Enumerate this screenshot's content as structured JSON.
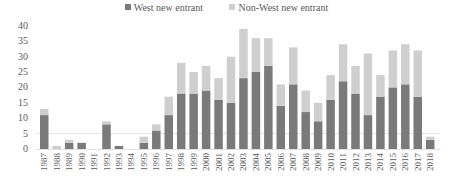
{
  "chart_data": {
    "type": "bar",
    "stacked": true,
    "title": "",
    "xlabel": "",
    "ylabel": "",
    "ylim": [
      0,
      40
    ],
    "yticks": [
      0,
      5,
      10,
      15,
      20,
      25,
      30,
      35,
      40
    ],
    "grid": false,
    "legend_position": "top",
    "categories": [
      "1987",
      "1988",
      "1989",
      "1990",
      "1991",
      "1992",
      "1993",
      "1994",
      "1995",
      "1996",
      "1997",
      "1998",
      "1999",
      "2000",
      "2001",
      "2002",
      "2003",
      "2004",
      "2005",
      "2006",
      "2007",
      "2008",
      "2009",
      "2010",
      "2011",
      "2012",
      "2013",
      "2014",
      "2015",
      "2016",
      "2017",
      "2018"
    ],
    "series": [
      {
        "name": "West new entrant",
        "color": "#7a7a7a",
        "values": [
          11,
          0,
          2,
          2,
          0,
          8,
          1,
          0,
          2,
          6,
          11,
          18,
          18,
          19,
          16,
          15,
          23,
          25,
          27,
          14,
          21,
          12,
          9,
          16,
          22,
          18,
          11,
          17,
          20,
          21,
          17,
          3
        ]
      },
      {
        "name": "Non-West new entrant",
        "color": "#cfcfcf",
        "values": [
          2,
          1,
          1,
          0,
          0,
          1,
          0,
          0,
          2,
          2,
          6,
          10,
          7,
          8,
          7,
          15,
          16,
          11,
          9,
          7,
          12,
          7,
          6,
          8,
          12,
          9,
          20,
          7,
          12,
          13,
          15,
          1
        ]
      }
    ]
  },
  "legend": {
    "items": [
      {
        "label": "West new entrant",
        "color": "#7a7a7a"
      },
      {
        "label": "Non-West new entrant",
        "color": "#cfcfcf"
      }
    ]
  }
}
